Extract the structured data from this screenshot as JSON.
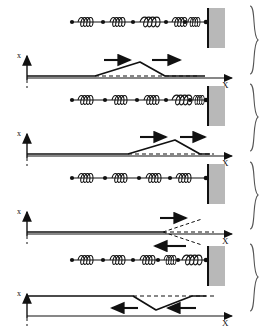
{
  "figure": {
    "panel_count": 4,
    "background_color": "#ffffff",
    "ink_color": "#111111",
    "wall_fill_color": "#b8b8b8",
    "wall_edge_color": "#111111"
  },
  "axes": {
    "y_label": "x",
    "x_label": "X",
    "y_axis_name": "displacement-axis",
    "x_axis_name": "position-axis"
  },
  "panels": [
    {
      "index": 1,
      "name": "panel-pulse-incoming",
      "spring_row": {
        "bead_count": 6,
        "coil_groups": 5,
        "description": "beaded spring chain anchored at wall"
      },
      "pulse": {
        "type": "triangle",
        "polarity": "up",
        "start_x": 95,
        "peak_x": 140,
        "end_x": 165,
        "amplitude": 13
      },
      "arrows": [
        {
          "name": "arrow-right-leading",
          "direction": "right",
          "x": 104,
          "y": 58
        },
        {
          "name": "arrow-right-trailing",
          "direction": "right",
          "x": 152,
          "y": 58
        }
      ],
      "brace": "}"
    },
    {
      "index": 2,
      "name": "panel-pulse-approaching-wall",
      "spring_row": {
        "bead_count": 6,
        "coil_groups": 5,
        "description": "beaded spring chain anchored at wall"
      },
      "pulse": {
        "type": "triangle",
        "polarity": "up",
        "start_x": 128,
        "peak_x": 175,
        "end_x": 200,
        "amplitude": 13
      },
      "arrows": [
        {
          "name": "arrow-right-leading",
          "direction": "right",
          "x": 140,
          "y": 135
        },
        {
          "name": "arrow-right-trailing",
          "direction": "right",
          "x": 180,
          "y": 135
        }
      ],
      "brace": "}"
    },
    {
      "index": 3,
      "name": "panel-pulse-at-wall",
      "spring_row": {
        "bead_count": 6,
        "coil_groups": 5,
        "description": "beaded spring chain anchored at wall"
      },
      "pulse": {
        "type": "cancellation",
        "polarity": "none",
        "vertex_x": 163,
        "upper_dashed_end_x": 202,
        "lower_dashed_end_x": 202,
        "amplitude": 13
      },
      "arrows": [
        {
          "name": "arrow-right-incident",
          "direction": "right",
          "x": 160,
          "y": 205
        },
        {
          "name": "arrow-left-reflected",
          "direction": "left",
          "x": 155,
          "y": 228
        }
      ],
      "brace": "}"
    },
    {
      "index": 4,
      "name": "panel-pulse-reflected-inverted",
      "spring_row": {
        "bead_count": 6,
        "coil_groups": 5,
        "description": "beaded spring chain anchored at wall"
      },
      "pulse": {
        "type": "triangle",
        "polarity": "down",
        "start_x": 133,
        "trough_x": 156,
        "end_x": 192,
        "amplitude": 13
      },
      "arrows": [
        {
          "name": "arrow-left-leading",
          "direction": "left",
          "x": 112,
          "y": 307
        },
        {
          "name": "arrow-left-trailing",
          "direction": "left",
          "x": 168,
          "y": 307
        }
      ],
      "brace": "}"
    }
  ]
}
